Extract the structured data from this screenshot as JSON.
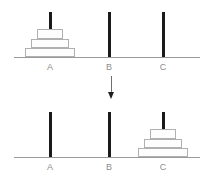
{
  "diagram": {
    "type": "tower-of-hanoi",
    "background_color": "#ffffff",
    "line_color": "#9a9a9a",
    "peg_color": "#1a1a1a",
    "disc_fill": "#fdfdfd",
    "disc_border": "#b0b0b0",
    "label_color": "#8c8c8c",
    "arrow_color": "#1f1f1f"
  },
  "panels": [
    {
      "id": "start",
      "name": "initial-state",
      "pegs": [
        {
          "label": "A",
          "x": 50,
          "discs": [
            {
              "width": 50,
              "height": 9,
              "name": "disc-large"
            },
            {
              "width": 38,
              "height": 9,
              "name": "disc-medium"
            },
            {
              "width": 26,
              "height": 10,
              "name": "disc-small"
            }
          ]
        },
        {
          "label": "B",
          "x": 109,
          "discs": []
        },
        {
          "label": "C",
          "x": 163,
          "discs": []
        }
      ]
    },
    {
      "id": "end",
      "name": "final-state",
      "pegs": [
        {
          "label": "A",
          "x": 50,
          "discs": []
        },
        {
          "label": "B",
          "x": 109,
          "discs": []
        },
        {
          "label": "C",
          "x": 163,
          "discs": [
            {
              "width": 50,
              "height": 9,
              "name": "disc-large"
            },
            {
              "width": 38,
              "height": 9,
              "name": "disc-medium"
            },
            {
              "width": 26,
              "height": 10,
              "name": "disc-small"
            }
          ]
        }
      ]
    }
  ],
  "arrow": {
    "name": "downward-arrow-icon",
    "direction": "down",
    "label": ""
  },
  "labels": {
    "a": "A",
    "b": "B",
    "c": "C"
  }
}
